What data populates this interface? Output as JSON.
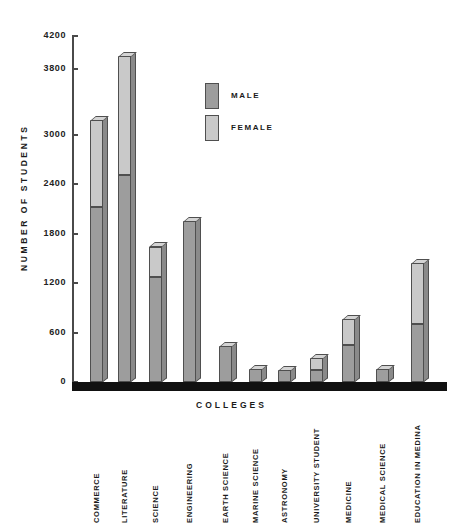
{
  "chart_data": {
    "type": "bar",
    "subtype": "stacked-vertical-3d",
    "title": "",
    "xlabel": "COLLEGES",
    "ylabel": "NUMBER OF STUDENTS",
    "ylim": [
      0,
      4200
    ],
    "grid": false,
    "legend_position": "inside-upper-center",
    "y_ticks": [
      0,
      600,
      1200,
      1800,
      2400,
      3000,
      3800,
      4200
    ],
    "y_tick_labels": [
      "0",
      "600",
      "1200",
      "1800",
      "2400",
      "3000",
      "3800",
      "4200"
    ],
    "categories": [
      "COMMERCE",
      "LITERATURE",
      "SCIENCE",
      "ENGINEERING",
      "EARTH SCIENCE",
      "MARINE SCIENCE",
      "ASTRONOMY",
      "UNIVERSITY STUDENT",
      "MEDICINE",
      "MEDICAL SCIENCE",
      "EDUCATION IN MEDINA"
    ],
    "series": [
      {
        "name": "MALE",
        "color": "#9d9d9d",
        "values": [
          2120,
          2510,
          1270,
          1960,
          440,
          160,
          150,
          140,
          450,
          160,
          700
        ]
      },
      {
        "name": "FEMALE",
        "color": "#c9c9c9",
        "values": [
          1060,
          1450,
          375,
          0,
          0,
          0,
          0,
          150,
          315,
          0,
          750
        ]
      }
    ],
    "totals": [
      3180,
      3960,
      1645,
      1960,
      440,
      160,
      150,
      290,
      765,
      160,
      1450
    ]
  },
  "legend": {
    "items": [
      {
        "label": "MALE",
        "key": "male"
      },
      {
        "label": "FEMALE",
        "key": "female"
      }
    ]
  }
}
